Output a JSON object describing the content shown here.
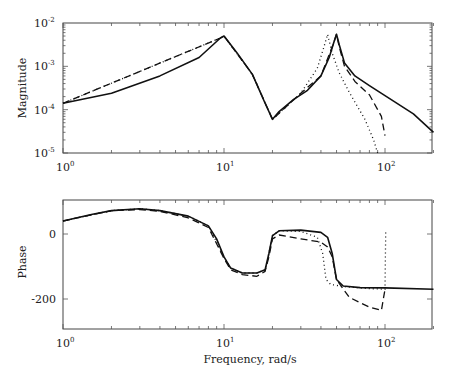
{
  "chart_data": [
    {
      "type": "line",
      "title": "",
      "xlabel": "",
      "ylabel": "Magnitude",
      "xscale": "log",
      "yscale": "log",
      "xlim": [
        1,
        200
      ],
      "ylim": [
        1e-05,
        0.01
      ],
      "x_ticks": [
        "10^0",
        "10^1",
        "10^2"
      ],
      "y_ticks": [
        "10^-5",
        "10^-4",
        "10^-3",
        "10^-2"
      ],
      "grid": false,
      "legend": null,
      "series": [
        {
          "name": "solid",
          "style": "solid",
          "x": [
            1,
            2,
            4,
            7,
            9.5,
            10,
            12,
            15,
            18,
            20,
            22,
            27,
            33,
            40,
            45,
            48,
            50,
            52,
            56,
            65,
            80,
            100,
            150,
            200
          ],
          "y": [
            0.00014,
            0.00024,
            0.0006,
            0.0016,
            0.0045,
            0.005,
            0.0021,
            0.00065,
            0.00014,
            6e-05,
            9e-05,
            0.00017,
            0.00028,
            0.0006,
            0.0016,
            0.0035,
            0.0055,
            0.0031,
            0.0012,
            0.0006,
            0.00036,
            0.00021,
            8e-05,
            3e-05
          ]
        },
        {
          "name": "dashed",
          "style": "dashed",
          "x": [
            1,
            9.5,
            10,
            15,
            20,
            30,
            40,
            48,
            50,
            52,
            56,
            65,
            80,
            95,
            100
          ],
          "y": [
            0.00014,
            0.0045,
            0.005,
            0.00065,
            6e-05,
            0.00024,
            0.0006,
            0.0035,
            0.0055,
            0.0028,
            0.001,
            0.00045,
            0.00022,
            7e-05,
            2.5e-05
          ]
        },
        {
          "name": "dotted",
          "style": "dotted",
          "x": [
            1,
            9.5,
            10,
            15,
            20,
            30,
            38,
            42,
            44,
            47,
            52,
            60,
            75,
            85,
            90
          ],
          "y": [
            0.00014,
            0.0045,
            0.005,
            0.00065,
            6e-05,
            0.00024,
            0.0009,
            0.003,
            0.0055,
            0.002,
            0.0007,
            0.00025,
            6e-05,
            2e-05,
            1e-05
          ]
        }
      ]
    },
    {
      "type": "line",
      "title": "",
      "xlabel": "Frequency, rad/s",
      "ylabel": "Phase",
      "xscale": "log",
      "yscale": "linear",
      "xlim": [
        1,
        200
      ],
      "ylim": [
        -300,
        105
      ],
      "x_ticks": [
        "10^0",
        "10^1",
        "10^2"
      ],
      "y_ticks": [
        "-200",
        "0"
      ],
      "grid": false,
      "legend": null,
      "series": [
        {
          "name": "solid",
          "style": "solid",
          "x": [
            1,
            1.5,
            2,
            3,
            4,
            6,
            8,
            9,
            10,
            11,
            13,
            16,
            18,
            19,
            20,
            22,
            30,
            40,
            44,
            47,
            50,
            55,
            70,
            100,
            200
          ],
          "y": [
            40,
            60,
            72,
            78,
            72,
            55,
            25,
            -15,
            -70,
            -105,
            -120,
            -120,
            -110,
            -60,
            -5,
            10,
            12,
            5,
            -10,
            -60,
            -140,
            -160,
            -165,
            -166,
            -170
          ]
        },
        {
          "name": "dashed",
          "style": "dashed",
          "x": [
            1,
            2,
            3,
            4,
            6,
            8,
            10,
            11,
            13,
            16,
            18,
            19,
            20,
            22,
            30,
            40,
            44,
            47,
            50,
            60,
            80,
            95,
            100
          ],
          "y": [
            40,
            72,
            75,
            70,
            50,
            20,
            -75,
            -110,
            -125,
            -130,
            -115,
            -70,
            -15,
            -3,
            -15,
            -25,
            -40,
            -70,
            -140,
            -195,
            -225,
            -235,
            -170
          ]
        },
        {
          "name": "dotted",
          "style": "dotted",
          "x": [
            1,
            2,
            3,
            4,
            6,
            8,
            10,
            11,
            13,
            16,
            18,
            19,
            20,
            22,
            30,
            38,
            41,
            43,
            46,
            55,
            80,
            100,
            101
          ],
          "y": [
            40,
            72,
            78,
            72,
            55,
            25,
            -70,
            -105,
            -120,
            -120,
            -110,
            -60,
            -5,
            10,
            8,
            -10,
            -60,
            -140,
            -155,
            -162,
            -168,
            -170,
            5
          ]
        }
      ]
    }
  ],
  "labels": {
    "top_ylabel": "Magnitude",
    "bottom_ylabel": "Phase",
    "xlabel": "Frequency, rad/s",
    "x_tick_base": "10",
    "x_tick_exps": [
      "0",
      "1",
      "2"
    ],
    "top_y_tick_exps": [
      "-2",
      "-3",
      "-4",
      "-5"
    ],
    "bottom_y_ticks": [
      "0",
      "-200"
    ]
  }
}
